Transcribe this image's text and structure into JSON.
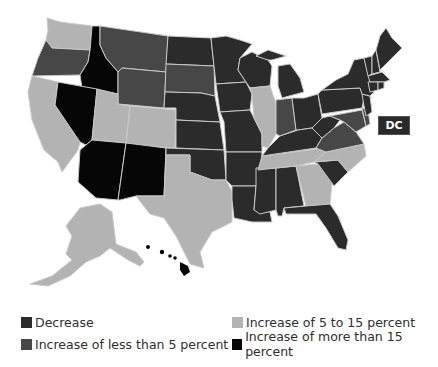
{
  "colors": {
    "decrease": "#2b2b2b",
    "increase_lt5": "#474747",
    "increase_5to15": "#b3b3b3",
    "increase_gt15": "#060606",
    "border": "#c9c9c9"
  },
  "map": {
    "dc_label": "DC",
    "categories": {
      "decrease": [
        "ND",
        "MN",
        "WI",
        "MI",
        "IA",
        "NE",
        "KS",
        "MO",
        "OK",
        "AR",
        "LA",
        "MS",
        "AL",
        "FL",
        "SC",
        "OH",
        "KY",
        "WV",
        "PA",
        "NY",
        "VT",
        "NH",
        "ME",
        "MA",
        "CT",
        "RI",
        "NJ",
        "IL_excluded"
      ],
      "increase_lt5": [
        "OR",
        "MT",
        "WY",
        "SD",
        "IN",
        "VA",
        "MD",
        "DE",
        "DC"
      ],
      "increase_5to15": [
        "WA",
        "CA",
        "UT",
        "CO",
        "TX",
        "IL",
        "TN",
        "NC",
        "GA",
        "AK"
      ],
      "increase_gt15": [
        "ID",
        "NV",
        "AZ",
        "NM",
        "HI"
      ]
    }
  },
  "legend": {
    "items": [
      {
        "label": "Decrease",
        "key": "decrease"
      },
      {
        "label": "Increase of less than 5 percent",
        "key": "increase_lt5"
      },
      {
        "label": "Increase of 5 to 15 percent",
        "key": "increase_5to15"
      },
      {
        "label": "Increase of more than 15 percent",
        "key": "increase_gt15"
      }
    ]
  }
}
